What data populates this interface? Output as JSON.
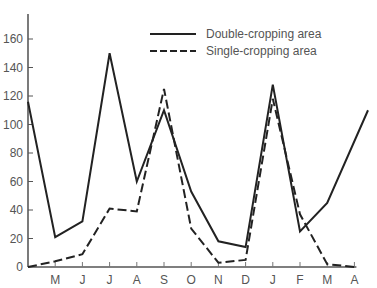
{
  "chart_data": {
    "type": "line",
    "title": "",
    "xlabel": "",
    "ylabel": "",
    "ylim": [
      0,
      175
    ],
    "yticks": [
      0,
      20,
      40,
      60,
      80,
      100,
      120,
      140,
      160
    ],
    "categories": [
      "",
      "M",
      "J",
      "J",
      "A",
      "S",
      "O",
      "N",
      "D",
      "J",
      "F",
      "M",
      "A"
    ],
    "grid": false,
    "legend_position": "top-right",
    "series": [
      {
        "name": "Double-cropping area",
        "style": "solid",
        "color": "#222222",
        "values": [
          116,
          21,
          32,
          150,
          60,
          110,
          53,
          18,
          14,
          128,
          25,
          45,
          95
        ],
        "end_point": {
          "x_offset_months": 0.5,
          "value": 110
        }
      },
      {
        "name": "Single-cropping area",
        "style": "dashed",
        "color": "#222222",
        "values": [
          0,
          4,
          9,
          41,
          39,
          125,
          27,
          3,
          5,
          118,
          37,
          2,
          0
        ]
      }
    ]
  }
}
